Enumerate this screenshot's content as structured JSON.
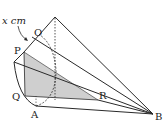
{
  "diagram": {
    "type": "3d-solid-geometry",
    "labels": {
      "dimension": "x cm",
      "O": "O",
      "P": "P",
      "Q": "Q",
      "A": "A",
      "R": "R",
      "B": "B"
    },
    "colors": {
      "line": "#2a2a2a",
      "shade": "#cfcfcf"
    }
  }
}
